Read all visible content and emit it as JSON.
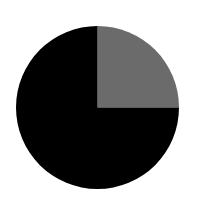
{
  "chart_data": {
    "type": "pie",
    "title": "",
    "categories": [
      "Slice A",
      "Slice B"
    ],
    "values": [
      25,
      75
    ],
    "colors": [
      "#6b6b6b",
      "#000000"
    ],
    "start_angle_deg": 0,
    "direction": "clockwise",
    "legend": "none",
    "labels_shown": false
  },
  "layout": {
    "center_x": 97.5,
    "center_y": 107.5,
    "radius": 81.5,
    "background": "#ffffff"
  }
}
